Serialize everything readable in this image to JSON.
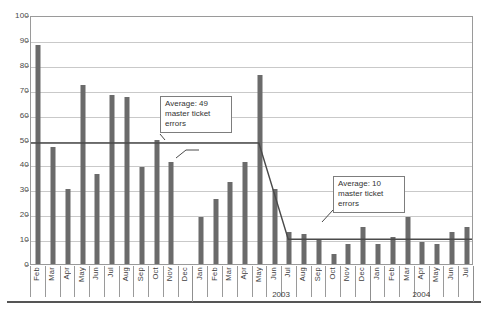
{
  "chart_data": {
    "type": "bar",
    "title": "",
    "subtitle": "",
    "xlabel": "",
    "ylabel": "",
    "ylim": [
      0,
      100
    ],
    "ytick_step": 10,
    "yticks": [
      0,
      10,
      20,
      30,
      40,
      50,
      60,
      70,
      80,
      90,
      100
    ],
    "grid": true,
    "legend": "none",
    "bar_color": "#6b6b6b",
    "gridline_color": "#c9c9c9",
    "axis_color": "#9a9a9a",
    "categories": [
      "Feb",
      "Mar",
      "Apr",
      "May",
      "Jun",
      "Jul",
      "Aug",
      "Sep",
      "Oct",
      "Nov",
      "Dec",
      "Jan",
      "Feb",
      "Mar",
      "Apr",
      "May",
      "Jun",
      "Jul",
      "Aug",
      "Sep",
      "Oct",
      "Nov",
      "Dec",
      "Jan",
      "Feb",
      "Mar",
      "Apr",
      "May",
      "Jun",
      "Jul"
    ],
    "values": [
      88,
      47,
      30,
      72,
      36,
      68,
      67,
      39,
      50,
      41,
      0,
      19,
      26,
      33,
      41,
      76,
      30,
      13,
      12,
      10,
      4,
      8,
      15,
      8,
      11,
      19,
      9,
      8,
      13,
      15
    ],
    "series": [
      {
        "name": "master ticket errors",
        "values": [
          88,
          47,
          30,
          72,
          36,
          68,
          67,
          39,
          50,
          41,
          0,
          19,
          26,
          33,
          41,
          76,
          30,
          13,
          12,
          10,
          4,
          8,
          15,
          8,
          11,
          19,
          9,
          8,
          13,
          15
        ]
      }
    ],
    "reference_lines": [
      {
        "name": "average-49",
        "value": 49,
        "from_index": 0,
        "to_index": 15
      },
      {
        "name": "average-10",
        "value": 10,
        "from_index": 18,
        "to_index": 29
      }
    ],
    "year_groups": [
      {
        "label": "",
        "start_index": 0,
        "end_index": 10
      },
      {
        "label": "2003",
        "start_index": 11,
        "end_index": 22
      },
      {
        "label": "2004",
        "start_index": 23,
        "end_index": 29
      }
    ],
    "annotations": [
      {
        "name": "average-49-callout",
        "text": "Average: 49\nmaster ticket\nerrors",
        "value": 49
      },
      {
        "name": "average-10-callout",
        "text": "Average: 10\nmaster ticket\nerrors",
        "value": 10
      }
    ]
  },
  "yaxis": {
    "labels": [
      "100",
      "90",
      "80",
      "70",
      "60",
      "50",
      "40",
      "30",
      "20",
      "10",
      "0"
    ]
  },
  "years": {
    "y2003": "2003",
    "y2004": "2004"
  },
  "callouts": {
    "avg49": "Average: 49\nmaster ticket\nerrors",
    "avg10": "Average: 10\nmaster ticket\nerrors"
  }
}
